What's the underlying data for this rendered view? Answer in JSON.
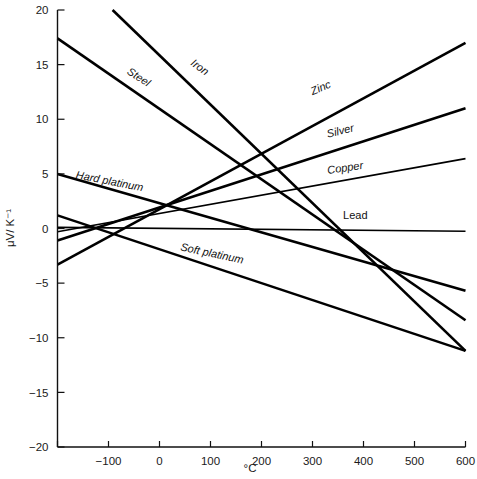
{
  "chart_data": {
    "type": "line",
    "title": "",
    "xlabel": "°C",
    "ylabel": "μV/ K⁻¹",
    "xlim": [
      -200,
      600
    ],
    "ylim": [
      -20,
      20
    ],
    "grid": false,
    "legend": "inline-labels",
    "xticks": [
      -200,
      -100,
      0,
      100,
      200,
      300,
      400,
      500,
      600
    ],
    "xtick_labels": [
      "",
      "−100",
      "0",
      "100",
      "200",
      "300",
      "400",
      "500",
      "600"
    ],
    "yticks": [
      -20,
      -15,
      -10,
      -5,
      0,
      5,
      10,
      15,
      20
    ],
    "ytick_labels": [
      "−20",
      "−15",
      "−10",
      "−5",
      "0",
      "5",
      "10",
      "15",
      "20"
    ],
    "series": [
      {
        "name": "Iron",
        "label": "Iron",
        "label_x": 60,
        "label_y": 15.0,
        "label_rotation": 36,
        "x": [
          -92,
          600
        ],
        "y": [
          20.0,
          -11.2
        ]
      },
      {
        "name": "Steel",
        "label": "Steel",
        "label_x": -65,
        "label_y": 14.2,
        "label_rotation": 33,
        "x": [
          -200,
          600
        ],
        "y": [
          17.4,
          -8.4
        ]
      },
      {
        "name": "Hard platinum",
        "label": "Hard platinum",
        "label_x": -165,
        "label_y": 4.6,
        "label_rotation": 11,
        "x": [
          -200,
          600
        ],
        "y": [
          5.0,
          -5.7
        ]
      },
      {
        "name": "Soft platinum",
        "label": "Soft platinum",
        "label_x": 40,
        "label_y": -2.0,
        "label_rotation": 12,
        "x": [
          -200,
          600
        ],
        "y": [
          1.2,
          -11.2
        ]
      },
      {
        "name": "Zinc",
        "label": "Zinc",
        "label_x": 300,
        "label_y": 12.2,
        "label_rotation": -23,
        "x": [
          -200,
          600
        ],
        "y": [
          -3.3,
          17.0
        ]
      },
      {
        "name": "Silver",
        "label": "Silver",
        "label_x": 330,
        "label_y": 8.3,
        "label_rotation": -14,
        "x": [
          -200,
          600
        ],
        "y": [
          -1.1,
          11.0
        ]
      },
      {
        "name": "Copper",
        "label": "Copper",
        "label_x": 330,
        "label_y": 5.0,
        "label_rotation": -8,
        "x": [
          -200,
          600
        ],
        "y": [
          -0.3,
          6.4
        ]
      },
      {
        "name": "Lead",
        "label": "Lead",
        "label_x": 360,
        "label_y": 0.9,
        "label_rotation": 0,
        "x": [
          -200,
          600
        ],
        "y": [
          0.1,
          -0.25
        ]
      }
    ]
  },
  "axes": {
    "x_title": "°C",
    "y_title": "μV/ K⁻¹"
  }
}
